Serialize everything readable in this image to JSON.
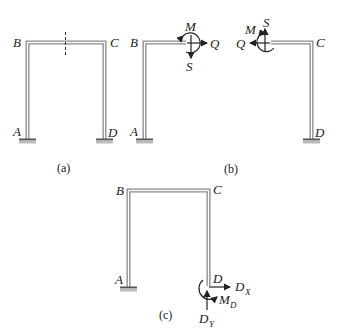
{
  "figure": {
    "colors": {
      "member": "#888888",
      "member_fill": "#ffffff",
      "ink": "#222222",
      "support": "#666666"
    },
    "part_a": {
      "caption": "(a)",
      "labels": {
        "B": "B",
        "C": "C",
        "A": "A",
        "D": "D"
      }
    },
    "part_b": {
      "caption": "(b)",
      "left": {
        "labels": {
          "B": "B",
          "A": "A",
          "M": "M",
          "Q": "Q",
          "S": "S"
        }
      },
      "right": {
        "labels": {
          "C": "C",
          "D": "D",
          "M": "M",
          "Q": "Q",
          "S": "S"
        }
      }
    },
    "part_c": {
      "caption": "(c)",
      "labels": {
        "B": "B",
        "C": "C",
        "A": "A",
        "D": "D",
        "DX": "D",
        "DX_sub": "X",
        "MD": "M",
        "MD_sub": "D",
        "DY": "D",
        "DY_sub": "Y"
      }
    }
  }
}
